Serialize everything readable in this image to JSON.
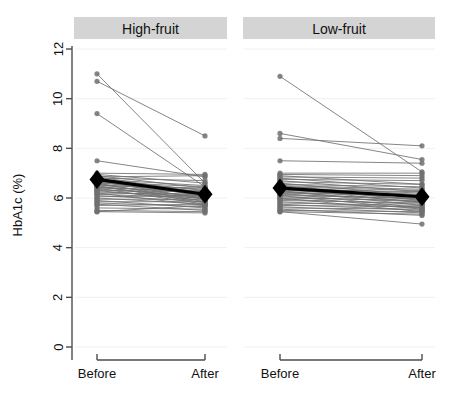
{
  "figure": {
    "ylabel": "HbA1c (%)",
    "ytick_labels": [
      "0",
      "2",
      "4",
      "6",
      "8",
      "10",
      "12"
    ],
    "xtick_labels": [
      "Before",
      "After"
    ],
    "strip_fill": "#d4d4d4",
    "line_color": "#6f6f6f",
    "point_color": "#707070",
    "mean_color": "#000000",
    "axis_color": "#4d4d4d",
    "grid_color": "#f0f0f0"
  },
  "chart_data": {
    "type": "line",
    "title": "",
    "subtitle": "",
    "xlabel": "",
    "ylabel": "HbA1c (%)",
    "ylim": [
      0,
      12
    ],
    "yticks": [
      0,
      2,
      4,
      6,
      8,
      10,
      12
    ],
    "x": [
      "Before",
      "After"
    ],
    "grid": true,
    "legend": "none",
    "panel_layout": "1x2",
    "panels": [
      {
        "name": "High-fruit",
        "mean_series": {
          "name": "Mean",
          "values": [
            6.75,
            6.15
          ],
          "marker": "diamond"
        },
        "series": [
          {
            "name": "s1",
            "values": [
              11.0,
              6.6
            ]
          },
          {
            "name": "s2",
            "values": [
              10.7,
              8.5
            ]
          },
          {
            "name": "s3",
            "values": [
              9.4,
              6.45
            ]
          },
          {
            "name": "s4",
            "values": [
              7.5,
              6.85
            ]
          },
          {
            "name": "s5",
            "values": [
              7.0,
              6.95
            ]
          },
          {
            "name": "s6",
            "values": [
              6.95,
              6.6
            ]
          },
          {
            "name": "s7",
            "values": [
              6.9,
              6.4
            ]
          },
          {
            "name": "s8",
            "values": [
              6.85,
              6.9
            ]
          },
          {
            "name": "s9",
            "values": [
              6.85,
              6.2
            ]
          },
          {
            "name": "s10",
            "values": [
              6.8,
              6.7
            ]
          },
          {
            "name": "s11",
            "values": [
              6.8,
              6.05
            ]
          },
          {
            "name": "s12",
            "values": [
              6.75,
              6.5
            ]
          },
          {
            "name": "s13",
            "values": [
              6.75,
              6.3
            ]
          },
          {
            "name": "s14",
            "values": [
              6.7,
              6.15
            ]
          },
          {
            "name": "s15",
            "values": [
              6.7,
              5.95
            ]
          },
          {
            "name": "s16",
            "values": [
              6.65,
              6.45
            ]
          },
          {
            "name": "s17",
            "values": [
              6.65,
              6.1
            ]
          },
          {
            "name": "s18",
            "values": [
              6.6,
              6.35
            ]
          },
          {
            "name": "s19",
            "values": [
              6.6,
              5.85
            ]
          },
          {
            "name": "s20",
            "values": [
              6.55,
              6.25
            ]
          },
          {
            "name": "s21",
            "values": [
              6.55,
              6.0
            ]
          },
          {
            "name": "s22",
            "values": [
              6.5,
              6.4
            ]
          },
          {
            "name": "s23",
            "values": [
              6.5,
              5.8
            ]
          },
          {
            "name": "s24",
            "values": [
              6.45,
              6.2
            ]
          },
          {
            "name": "s25",
            "values": [
              6.45,
              5.95
            ]
          },
          {
            "name": "s26",
            "values": [
              6.4,
              6.3
            ]
          },
          {
            "name": "s27",
            "values": [
              6.4,
              5.75
            ]
          },
          {
            "name": "s28",
            "values": [
              6.35,
              6.1
            ]
          },
          {
            "name": "s29",
            "values": [
              6.3,
              6.25
            ]
          },
          {
            "name": "s30",
            "values": [
              6.3,
              5.9
            ]
          },
          {
            "name": "s31",
            "values": [
              6.25,
              6.05
            ]
          },
          {
            "name": "s32",
            "values": [
              6.2,
              6.15
            ]
          },
          {
            "name": "s33",
            "values": [
              6.2,
              5.7
            ]
          },
          {
            "name": "s34",
            "values": [
              6.15,
              6.0
            ]
          },
          {
            "name": "s35",
            "values": [
              6.1,
              5.85
            ]
          },
          {
            "name": "s36",
            "values": [
              6.05,
              6.1
            ]
          },
          {
            "name": "s37",
            "values": [
              6.0,
              5.75
            ]
          },
          {
            "name": "s38",
            "values": [
              5.95,
              5.95
            ]
          },
          {
            "name": "s39",
            "values": [
              5.9,
              5.6
            ]
          },
          {
            "name": "s40",
            "values": [
              5.85,
              5.85
            ]
          },
          {
            "name": "s41",
            "values": [
              5.8,
              5.65
            ]
          },
          {
            "name": "s42",
            "values": [
              5.75,
              5.5
            ]
          },
          {
            "name": "s43",
            "values": [
              5.7,
              5.75
            ]
          },
          {
            "name": "s44",
            "values": [
              5.6,
              5.55
            ]
          },
          {
            "name": "s45",
            "values": [
              5.5,
              5.45
            ]
          },
          {
            "name": "s46",
            "values": [
              5.45,
              5.7
            ]
          },
          {
            "name": "s47",
            "values": [
              5.45,
              5.4
            ]
          }
        ]
      },
      {
        "name": "Low-fruit",
        "mean_series": {
          "name": "Mean",
          "values": [
            6.4,
            6.05
          ],
          "marker": "diamond"
        },
        "series": [
          {
            "name": "t1",
            "values": [
              10.9,
              7.05
            ]
          },
          {
            "name": "t2",
            "values": [
              8.6,
              7.55
            ]
          },
          {
            "name": "t3",
            "values": [
              8.4,
              8.1
            ]
          },
          {
            "name": "t4",
            "values": [
              7.5,
              7.4
            ]
          },
          {
            "name": "t5",
            "values": [
              7.0,
              7.0
            ]
          },
          {
            "name": "t6",
            "values": [
              6.95,
              6.9
            ]
          },
          {
            "name": "t7",
            "values": [
              6.9,
              6.55
            ]
          },
          {
            "name": "t8",
            "values": [
              6.85,
              6.8
            ]
          },
          {
            "name": "t9",
            "values": [
              6.8,
              6.4
            ]
          },
          {
            "name": "t10",
            "values": [
              6.75,
              6.7
            ]
          },
          {
            "name": "t11",
            "values": [
              6.7,
              6.25
            ]
          },
          {
            "name": "t12",
            "values": [
              6.65,
              6.55
            ]
          },
          {
            "name": "t13",
            "values": [
              6.6,
              6.1
            ]
          },
          {
            "name": "t14",
            "values": [
              6.55,
              6.45
            ]
          },
          {
            "name": "t15",
            "values": [
              6.5,
              6.35
            ]
          },
          {
            "name": "t16",
            "values": [
              6.5,
              6.0
            ]
          },
          {
            "name": "t17",
            "values": [
              6.45,
              6.3
            ]
          },
          {
            "name": "t18",
            "values": [
              6.45,
              5.9
            ]
          },
          {
            "name": "t19",
            "values": [
              6.4,
              6.2
            ]
          },
          {
            "name": "t20",
            "values": [
              6.4,
              5.8
            ]
          },
          {
            "name": "t21",
            "values": [
              6.35,
              6.25
            ]
          },
          {
            "name": "t22",
            "values": [
              6.35,
              5.95
            ]
          },
          {
            "name": "t23",
            "values": [
              6.3,
              6.15
            ]
          },
          {
            "name": "t24",
            "values": [
              6.3,
              5.7
            ]
          },
          {
            "name": "t25",
            "values": [
              6.25,
              6.05
            ]
          },
          {
            "name": "t26",
            "values": [
              6.25,
              5.85
            ]
          },
          {
            "name": "t27",
            "values": [
              6.2,
              6.1
            ]
          },
          {
            "name": "t28",
            "values": [
              6.2,
              5.6
            ]
          },
          {
            "name": "t29",
            "values": [
              6.15,
              5.95
            ]
          },
          {
            "name": "t30",
            "values": [
              6.1,
              6.0
            ]
          },
          {
            "name": "t31",
            "values": [
              6.1,
              5.55
            ]
          },
          {
            "name": "t32",
            "values": [
              6.05,
              5.85
            ]
          },
          {
            "name": "t33",
            "values": [
              6.0,
              5.9
            ]
          },
          {
            "name": "t34",
            "values": [
              6.0,
              5.45
            ]
          },
          {
            "name": "t35",
            "values": [
              5.95,
              5.75
            ]
          },
          {
            "name": "t36",
            "values": [
              5.9,
              5.8
            ]
          },
          {
            "name": "t37",
            "values": [
              5.85,
              5.6
            ]
          },
          {
            "name": "t38",
            "values": [
              5.8,
              5.7
            ]
          },
          {
            "name": "t39",
            "values": [
              5.75,
              5.5
            ]
          },
          {
            "name": "t40",
            "values": [
              5.7,
              5.65
            ]
          },
          {
            "name": "t41",
            "values": [
              5.65,
              5.4
            ]
          },
          {
            "name": "t42",
            "values": [
              5.6,
              5.55
            ]
          },
          {
            "name": "t43",
            "values": [
              5.55,
              5.3
            ]
          },
          {
            "name": "t44",
            "values": [
              5.5,
              5.45
            ]
          },
          {
            "name": "t45",
            "values": [
              5.45,
              4.95
            ]
          },
          {
            "name": "t46",
            "values": [
              5.45,
              5.35
            ]
          }
        ]
      }
    ]
  }
}
